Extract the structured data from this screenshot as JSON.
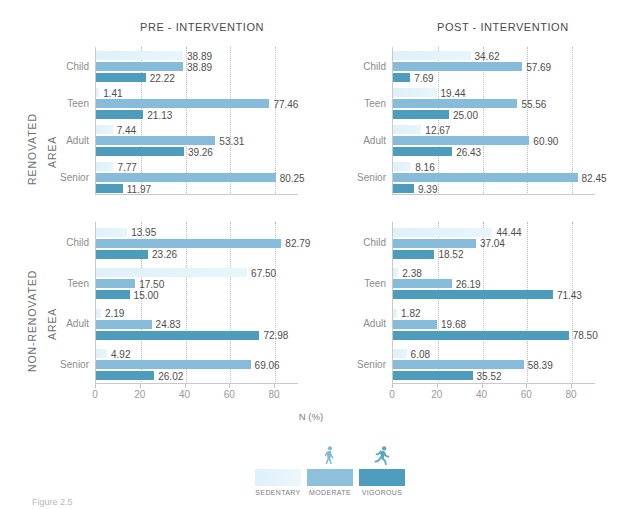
{
  "figure": {
    "caption": "Figure 2.5",
    "xaxis_title": "N (%)",
    "xticks": [
      0,
      20,
      40,
      60,
      80
    ],
    "xlim": [
      0,
      88
    ],
    "panel_titles": {
      "pre": "PRE - INTERVENTION",
      "post": "POST - INTERVENTION"
    },
    "group_labels": {
      "renovated_line1": "RENOVATED",
      "renovated_line2": "AREA",
      "nonrenovated_line1": "NON-RENOVATED",
      "nonrenovated_line2": "AREA"
    },
    "categories": [
      "Child",
      "Teen",
      "Adult",
      "Senior"
    ],
    "colors": {
      "sedentary": "#e4f3fa",
      "moderate": "#86bbd9",
      "vigorous": "#4d9cbb",
      "axis": "#c9c9c9",
      "grid": "#bcbcbc",
      "label_text": "#4e4e4e"
    }
  },
  "legend": {
    "position": "bottom-center",
    "items": [
      {
        "label": "SEDENTARY",
        "color": "#e4f3fa",
        "icon": "none"
      },
      {
        "label": "MODERATE",
        "color": "#86bbd9",
        "icon": "walking-person-icon"
      },
      {
        "label": "VIGOROUS",
        "color": "#4d9cbb",
        "icon": "running-person-icon"
      }
    ]
  },
  "chart_data": {
    "type": "bar",
    "orientation": "horizontal",
    "xlabel": "N (%)",
    "ylabel": "",
    "xlim": [
      0,
      88
    ],
    "xticks": [
      0,
      20,
      40,
      60,
      80
    ],
    "grid": true,
    "grid_axis": "x",
    "grid_style": "dotted",
    "categories": [
      "Child",
      "Teen",
      "Adult",
      "Senior"
    ],
    "series_names": [
      "SEDENTARY",
      "MODERATE",
      "VIGOROUS"
    ],
    "panels": [
      {
        "id": "pre-renovated",
        "column_title": "PRE - INTERVENTION",
        "row_title": "RENOVATED AREA",
        "series": [
          {
            "name": "SEDENTARY",
            "values": [
              38.89,
              1.41,
              7.44,
              7.77
            ]
          },
          {
            "name": "MODERATE",
            "values": [
              38.89,
              77.46,
              53.31,
              80.25
            ]
          },
          {
            "name": "VIGOROUS",
            "values": [
              22.22,
              21.13,
              39.26,
              11.97
            ]
          }
        ],
        "labels": [
          [
            "38.89",
            "38.89",
            "22.22"
          ],
          [
            "1.41",
            "77.46",
            "21.13"
          ],
          [
            "7.44",
            "53.31",
            "39.26"
          ],
          [
            "7.77",
            "80.25",
            "11.97"
          ]
        ]
      },
      {
        "id": "post-renovated",
        "column_title": "POST - INTERVENTION",
        "row_title": "RENOVATED AREA",
        "series": [
          {
            "name": "SEDENTARY",
            "values": [
              34.62,
              19.44,
              12.67,
              8.16
            ]
          },
          {
            "name": "MODERATE",
            "values": [
              57.69,
              55.56,
              60.9,
              82.45
            ]
          },
          {
            "name": "VIGOROUS",
            "values": [
              7.69,
              25.0,
              26.43,
              9.39
            ]
          }
        ],
        "labels": [
          [
            "34.62",
            "57.69",
            "7.69"
          ],
          [
            "19.44",
            "55.56",
            "25.00"
          ],
          [
            "12.67",
            "60.90",
            "26.43"
          ],
          [
            "8.16",
            "82.45",
            "9.39"
          ]
        ]
      },
      {
        "id": "pre-nonrenovated",
        "column_title": "PRE - INTERVENTION",
        "row_title": "NON-RENOVATED AREA",
        "series": [
          {
            "name": "SEDENTARY",
            "values": [
              13.95,
              67.5,
              2.19,
              4.92
            ]
          },
          {
            "name": "MODERATE",
            "values": [
              82.79,
              17.5,
              24.83,
              69.06
            ]
          },
          {
            "name": "VIGOROUS",
            "values": [
              23.26,
              15.0,
              72.98,
              26.02
            ]
          }
        ],
        "labels": [
          [
            "13.95",
            "82.79",
            "23.26"
          ],
          [
            "67.50",
            "17.50",
            "15.00"
          ],
          [
            "2.19",
            "24.83",
            "72.98"
          ],
          [
            "4.92",
            "69.06",
            "26.02"
          ]
        ]
      },
      {
        "id": "post-nonrenovated",
        "column_title": "POST - INTERVENTION",
        "row_title": "NON-RENOVATED AREA",
        "series": [
          {
            "name": "SEDENTARY",
            "values": [
              44.44,
              2.38,
              1.82,
              6.08
            ]
          },
          {
            "name": "MODERATE",
            "values": [
              37.04,
              26.19,
              19.68,
              58.39
            ]
          },
          {
            "name": "VIGOROUS",
            "values": [
              18.52,
              71.43,
              78.5,
              35.52
            ]
          }
        ],
        "labels": [
          [
            "44.44",
            "37.04",
            "18.52"
          ],
          [
            "2.38",
            "26.19",
            "71.43"
          ],
          [
            "1.82",
            "19.68",
            "78.50"
          ],
          [
            "6.08",
            "58.39",
            "35.52"
          ]
        ]
      }
    ],
    "panel_bar_order": {
      "pre-renovated": [
        [
          "sed",
          "38.89"
        ],
        [
          "mod",
          "38.89"
        ],
        [
          "vig",
          "22.22"
        ]
      ],
      "note": "Each category row draws 3 bars top-to-bottom in series order; in the post-nonrenovated Teen/Adult rows the longest bar is VIGOROUS."
    }
  }
}
